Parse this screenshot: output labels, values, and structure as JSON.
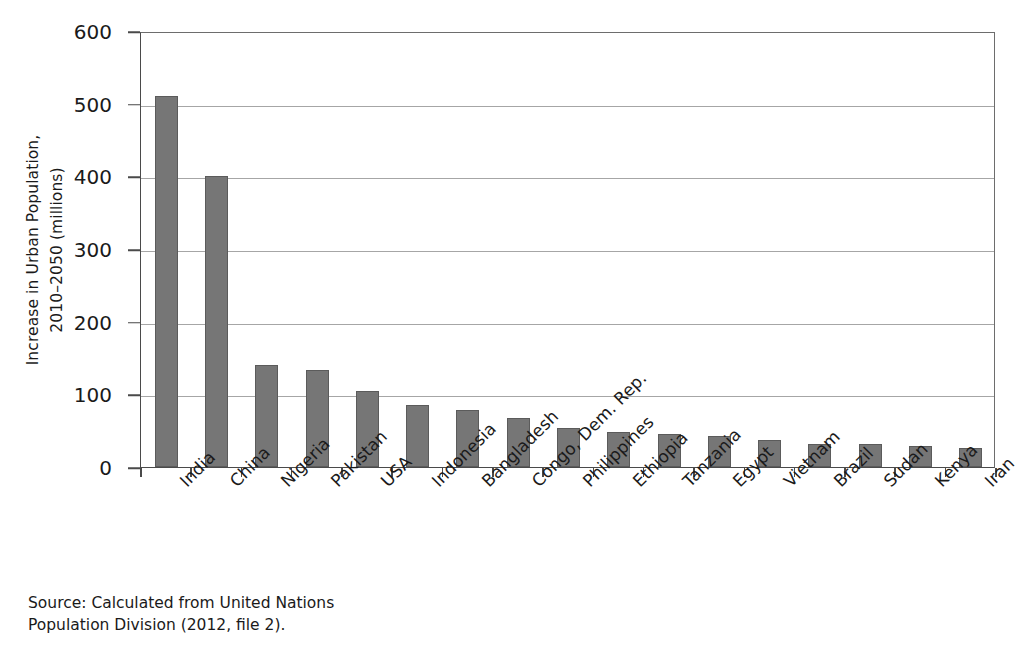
{
  "chart_data": {
    "type": "bar",
    "title": "",
    "xlabel": "",
    "ylabel": "Increase in Urban Population, 2010–2050 (millions)",
    "ylabel_lines": [
      "Increase in Urban Population,",
      "2010–2050 (millions)"
    ],
    "ylim": [
      0,
      600
    ],
    "yticks": [
      0,
      100,
      200,
      300,
      400,
      500,
      600
    ],
    "ytick_labels": [
      "0",
      "100",
      "200",
      "300",
      "400",
      "500",
      "600"
    ],
    "grid": true,
    "grid_axis": "y",
    "legend": false,
    "orientation": "vertical",
    "bar_color": "#767676",
    "bar_edge_color": "#5b5b5b",
    "gridline_color": "#a6a6a6",
    "axis_color": "#4a4a4a",
    "categories": [
      "India",
      "China",
      "Nigeria",
      "Pakistan",
      "USA",
      "Indonesia",
      "Bangladesh",
      "Congo, Dem. Rep.",
      "Philippines",
      "Ethiopia",
      "Tanzania",
      "Egypt",
      "Vietnam",
      "Brazil",
      "Sudan",
      "Kenya",
      "Iran"
    ],
    "values": [
      511,
      400,
      140,
      134,
      104,
      86,
      78,
      68,
      54,
      48,
      46,
      42,
      37,
      32,
      32,
      29,
      26
    ]
  },
  "source_note": "Source: Calculated from United Nations\nPopulation Division (2012, file 2)."
}
